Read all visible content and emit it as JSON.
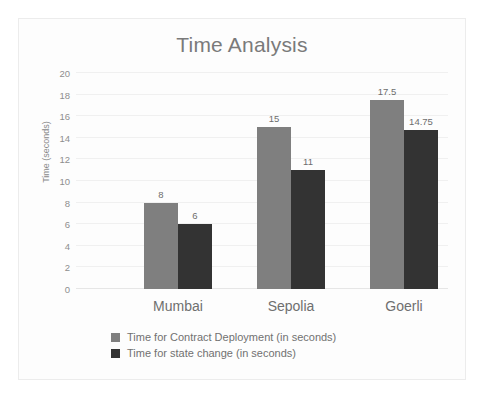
{
  "chart_data": {
    "type": "bar",
    "title": "Time Analysis",
    "xlabel": "",
    "ylabel": "Time (seconds)",
    "ylim": [
      0,
      20
    ],
    "ytick_step": 2,
    "yticks": [
      20,
      18,
      16,
      14,
      12,
      10,
      8,
      6,
      4,
      2,
      0
    ],
    "grid": true,
    "legend_position": "bottom",
    "categories": [
      "Mumbai",
      "Sepolia",
      "Goerli"
    ],
    "series": [
      {
        "name": "Time for Contract Deployment (in seconds)",
        "color": "#7f7f7f",
        "values": [
          8,
          15,
          17.5
        ],
        "labels": [
          "8",
          "15",
          "17.5"
        ]
      },
      {
        "name": "Time for state change (in seconds)",
        "color": "#333333",
        "values": [
          6,
          11,
          14.75
        ],
        "labels": [
          "6",
          "11",
          "14.75"
        ]
      }
    ]
  },
  "colors": {
    "series_a": "#7f7f7f",
    "series_b": "#333333",
    "title_text": "#7a7a7a",
    "axis_text": "#8e8e8e",
    "gridline": "#f0f0f0",
    "frame_border": "#ececec",
    "background": "#fdfdfd"
  }
}
